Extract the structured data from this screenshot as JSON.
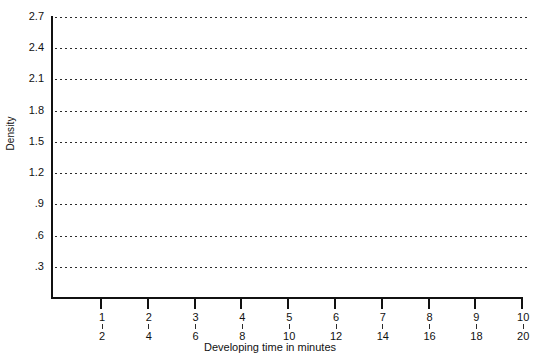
{
  "chart_data": {
    "type": "line",
    "title": "",
    "subtitle": "",
    "xlabel": "Developing time in minutes",
    "ylabel": "Density",
    "xlim": [
      0,
      10
    ],
    "ylim": [
      0,
      2.7
    ],
    "grid": true,
    "grid_axis": "y",
    "grid_style": "dotted",
    "legend": "none",
    "series": [],
    "annotations": [],
    "note": "Blank plotting grid — no data series are drawn",
    "y_ticks": [
      {
        "value": 2.7,
        "label": "2.7"
      },
      {
        "value": 2.4,
        "label": "2.4"
      },
      {
        "value": 2.1,
        "label": "2.1"
      },
      {
        "value": 1.8,
        "label": "1.8"
      },
      {
        "value": 1.5,
        "label": "1.5"
      },
      {
        "value": 1.2,
        "label": "1.2"
      },
      {
        "value": 0.9,
        "label": ".9"
      },
      {
        "value": 0.6,
        "label": ".6"
      },
      {
        "value": 0.3,
        "label": ".3"
      }
    ],
    "x_ticks": [
      {
        "value": 1,
        "label_top": "1",
        "label_bottom": "2"
      },
      {
        "value": 2,
        "label_top": "2",
        "label_bottom": "4"
      },
      {
        "value": 3,
        "label_top": "3",
        "label_bottom": "6"
      },
      {
        "value": 4,
        "label_top": "4",
        "label_bottom": "8"
      },
      {
        "value": 5,
        "label_top": "5",
        "label_bottom": "10"
      },
      {
        "value": 6,
        "label_top": "6",
        "label_bottom": "12"
      },
      {
        "value": 7,
        "label_top": "7",
        "label_bottom": "14"
      },
      {
        "value": 8,
        "label_top": "8",
        "label_bottom": "16"
      },
      {
        "value": 9,
        "label_top": "9",
        "label_bottom": "18"
      },
      {
        "value": 10,
        "label_top": "10",
        "label_bottom": "20"
      }
    ],
    "colors": {
      "background": "#ffffff",
      "axis": "#111111",
      "grid": "#2b2b2b",
      "text": "#111111"
    }
  }
}
